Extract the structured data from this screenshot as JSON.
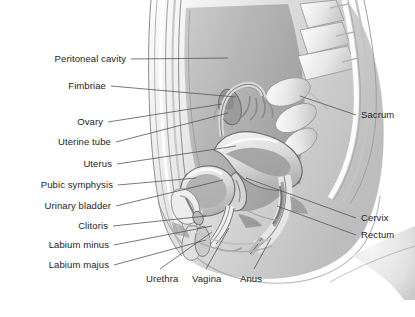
{
  "figure": {
    "view": "midsagittal",
    "background_color": "#ffffff",
    "label_color": "#1d1d1d",
    "leader_line_color": "#555555"
  },
  "labels_left": [
    {
      "text": "Peritoneal cavity",
      "x": 126,
      "y": 62,
      "lead_to_x": 228,
      "lead_to_y": 58
    },
    {
      "text": "Fimbriae",
      "x": 106,
      "y": 89,
      "lead_to_x": 236,
      "lead_to_y": 97
    },
    {
      "text": "Ovary",
      "x": 103,
      "y": 125,
      "lead_to_x": 222,
      "lead_to_y": 104
    },
    {
      "text": "Uterine tube",
      "x": 111,
      "y": 145,
      "lead_to_x": 228,
      "lead_to_y": 113
    },
    {
      "text": "Uterus",
      "x": 112,
      "y": 167,
      "lead_to_x": 236,
      "lead_to_y": 146
    },
    {
      "text": "Pubic symphysis",
      "x": 113,
      "y": 188,
      "lead_to_x": 196,
      "lead_to_y": 178
    },
    {
      "text": "Urinary bladder",
      "x": 111,
      "y": 209,
      "lead_to_x": 223,
      "lead_to_y": 180
    },
    {
      "text": "Clitoris",
      "x": 108,
      "y": 229,
      "lead_to_x": 206,
      "lead_to_y": 216
    },
    {
      "text": "Labium minus",
      "x": 109,
      "y": 248,
      "lead_to_x": 212,
      "lead_to_y": 226
    },
    {
      "text": "Labium majus",
      "x": 109,
      "y": 268,
      "lead_to_x": 206,
      "lead_to_y": 240
    }
  ],
  "labels_right": [
    {
      "text": "Sacrum",
      "x": 361,
      "y": 118,
      "lead_to_x": 300,
      "lead_to_y": 96
    },
    {
      "text": "Cervix",
      "x": 361,
      "y": 221,
      "lead_to_x": 246,
      "lead_to_y": 178
    },
    {
      "text": "Rectum",
      "x": 361,
      "y": 238,
      "lead_to_x": 277,
      "lead_to_y": 206
    }
  ],
  "labels_bottom": [
    {
      "text": "Urethra",
      "x": 146,
      "y": 282,
      "lead_to_x": 212,
      "lead_to_y": 232
    },
    {
      "text": "Vagina",
      "x": 192,
      "y": 282,
      "lead_to_x": 229,
      "lead_to_y": 228
    },
    {
      "text": "Anus",
      "x": 240,
      "y": 282,
      "lead_to_x": 271,
      "lead_to_y": 238
    }
  ],
  "palette": {
    "body_fill": "#e9e9e9",
    "body_shade": "#cfcfcf",
    "cavity_dark": "#9a9a9a",
    "organ_light": "#f2f2f2",
    "organ_mid": "#bdbdbd",
    "organ_dark": "#8d8d8d",
    "outline": "#6f6f6f"
  }
}
